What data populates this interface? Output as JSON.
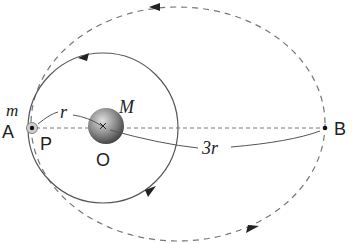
{
  "colors": {
    "line": "#555555",
    "dash": "#777777",
    "planet_light": "#d8d8d8",
    "planet_dark": "#4a4a4a",
    "text": "#222222"
  },
  "geometry": {
    "center_O": [
      103,
      128
    ],
    "circle_radius": 75,
    "ellipse_center": [
      178,
      124
    ],
    "ellipse_rx": 147,
    "ellipse_ry": 117,
    "point_A": [
      32,
      128
    ],
    "point_B": [
      325,
      128
    ]
  },
  "labels": {
    "m": "m",
    "M": "M",
    "r": "r",
    "three_r": "3r",
    "A": "A",
    "P": "P",
    "O": "O",
    "B": "B"
  },
  "orbits": [
    {
      "name": "circular-orbit",
      "style": "solid",
      "direction": "counterclockwise"
    },
    {
      "name": "elliptical-orbit",
      "style": "dashed",
      "direction": "counterclockwise"
    }
  ]
}
